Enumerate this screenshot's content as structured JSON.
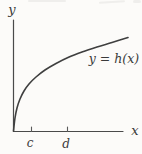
{
  "figure": {
    "background": "#fcfbf9",
    "ink_color": "#3f3f3f",
    "labels": {
      "y_axis": "y",
      "x_axis": "x",
      "tick_c": "c",
      "tick_d": "d",
      "curve_equation": "y = h(x)"
    },
    "axes": {
      "origin": [
        13.5,
        131.5
      ],
      "x_axis_end": 123,
      "y_axis_top": 20,
      "x_ticks": [
        31.5,
        67.5
      ],
      "tick_height": 4.5
    },
    "curve": {
      "description": "concave increasing sqrt-like curve from origin",
      "points": [
        [
          13.5,
          131.0
        ],
        [
          15.0,
          118.0
        ],
        [
          17.0,
          108.0
        ],
        [
          20.0,
          99.0
        ],
        [
          24.0,
          91.0
        ],
        [
          29.0,
          84.0
        ],
        [
          36.0,
          77.0
        ],
        [
          45.0,
          70.0
        ],
        [
          56.0,
          63.5
        ],
        [
          68.0,
          57.5
        ],
        [
          82.0,
          52.0
        ],
        [
          97.0,
          47.0
        ],
        [
          112.0,
          42.5
        ],
        [
          128.0,
          37.5
        ]
      ]
    }
  }
}
